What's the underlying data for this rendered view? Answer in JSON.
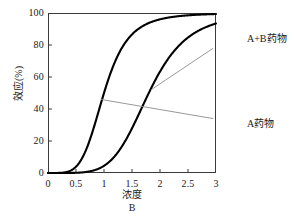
{
  "chart_data": {
    "type": "line",
    "title": "",
    "xlabel": "浓度",
    "xlabel_sub": "B",
    "ylabel": "效应(%)",
    "xlim": [
      0,
      3
    ],
    "ylim": [
      0,
      100
    ],
    "xticks": [
      "0",
      "0.5",
      "1",
      "1.5",
      "2",
      "2.5",
      "3"
    ],
    "xtick_values": [
      0,
      0.5,
      1,
      1.5,
      2,
      2.5,
      3
    ],
    "yticks": [
      "0",
      "20",
      "40",
      "60",
      "80",
      "100"
    ],
    "ytick_values": [
      0,
      20,
      40,
      60,
      80,
      100
    ],
    "grid": false,
    "legend_position": "annotation-labels-right",
    "series": [
      {
        "name": "A+B药物",
        "color": "#000000",
        "ec50": 1.0,
        "hill": 4.6,
        "x": [
          0.0,
          0.15,
          0.3,
          0.45,
          0.6,
          0.75,
          0.9,
          1.0,
          1.1,
          1.25,
          1.4,
          1.55,
          1.7,
          1.85,
          2.0,
          2.2,
          2.4,
          2.6,
          2.8,
          3.0
        ],
        "values": [
          0.0,
          0.1,
          0.7,
          3.1,
          9.4,
          21.8,
          40.7,
          50.0,
          59.3,
          72.3,
          82.0,
          88.5,
          92.7,
          95.4,
          97.0,
          98.4,
          99.1,
          99.5,
          99.7,
          99.8
        ]
      },
      {
        "name": "A药物",
        "color": "#000000",
        "ec50": 1.8,
        "hill": 5.2,
        "x": [
          0.0,
          0.3,
          0.6,
          0.8,
          1.0,
          1.15,
          1.3,
          1.45,
          1.6,
          1.8,
          2.0,
          2.15,
          2.3,
          2.5,
          2.7,
          2.85,
          3.0
        ],
        "values": [
          0.0,
          0.0,
          0.2,
          0.9,
          2.9,
          5.6,
          10.4,
          18.1,
          29.0,
          50.0,
          68.8,
          78.4,
          85.3,
          91.6,
          95.0,
          96.4,
          97.4
        ]
      }
    ],
    "annotations": [
      {
        "id": "annot-ab",
        "text": "A+B药物",
        "target_series": "A药物",
        "target_point": {
          "x": 1.84,
          "y": 52
        },
        "label_position": {
          "x": 2.95,
          "y": 78
        }
      },
      {
        "id": "annot-a",
        "text": "A药物",
        "target_series": "A+B药物",
        "target_point": {
          "x": 0.94,
          "y": 46
        },
        "label_position": {
          "x": 2.95,
          "y": 34
        }
      }
    ],
    "colors": {
      "curve": "#000000",
      "frame": "#3a3a3a",
      "leader": "#8c8c8c",
      "background": "#ffffff",
      "text": "#1a1a1a"
    }
  }
}
